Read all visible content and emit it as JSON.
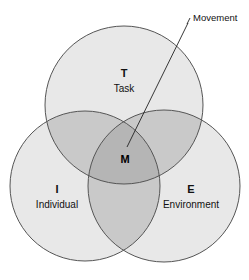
{
  "diagram": {
    "type": "venn-3-circle",
    "title_visible": false,
    "background_color": "#ffffff",
    "stroke_color": "#555555",
    "fill_single": "#e8e8e8",
    "fill_double": "#c9c9c9",
    "fill_triple": "#b5b5b5",
    "text_color": "#111111",
    "circles": [
      {
        "id": "task",
        "letter": "T",
        "label": "Task",
        "cx": 124,
        "cy": 105,
        "r": 79,
        "letter_x": 124,
        "letter_y": 74,
        "label_x": 124,
        "label_y": 89
      },
      {
        "id": "individual",
        "letter": "I",
        "label": "Individual",
        "cx": 85,
        "cy": 186,
        "r": 75,
        "letter_x": 57,
        "letter_y": 190,
        "label_x": 57,
        "label_y": 205
      },
      {
        "id": "environment",
        "letter": "E",
        "label": "Environment",
        "cx": 164,
        "cy": 186,
        "r": 76,
        "letter_x": 191,
        "letter_y": 190,
        "label_x": 191,
        "label_y": 205
      }
    ],
    "center": {
      "id": "movement",
      "letter": "M",
      "letter_x": 125,
      "letter_y": 160
    },
    "callout": {
      "id": "movement-callout",
      "label": "Movement",
      "text_x": 193,
      "text_y": 18,
      "leader_points": "187,24 190,18",
      "leader_line": "188,23 127,147"
    }
  }
}
